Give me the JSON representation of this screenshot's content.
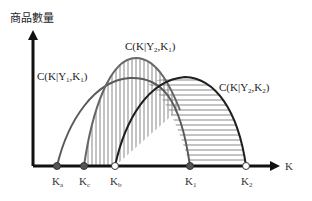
{
  "diagram": {
    "y_axis_label": "商品數量",
    "x_axis_label": "K",
    "curves": [
      {
        "id": "y1k1",
        "label_main": "C(K|Y",
        "label_sub1": "1",
        "label_mid": ",K",
        "label_sub2": "1",
        "label_end": ")",
        "color": "#555555"
      },
      {
        "id": "y2k1",
        "label_main": "C(K|Y",
        "label_sub1": "2",
        "label_mid": ",K",
        "label_sub2": "1",
        "label_end": ")",
        "color": "#666666",
        "hatch": "vertical"
      },
      {
        "id": "y2k2",
        "label_main": "C(K|Y",
        "label_sub1": "2",
        "label_mid": ",K",
        "label_sub2": "2",
        "label_end": ")",
        "color": "#222222",
        "hatch": "horizontal"
      }
    ],
    "x_points": [
      {
        "name": "K",
        "sub": "a",
        "marker": "filled"
      },
      {
        "name": "K",
        "sub": "c",
        "marker": "filled"
      },
      {
        "name": "K",
        "sub": "b",
        "marker": "open"
      },
      {
        "name": "K",
        "sub": "1",
        "marker": "filled"
      },
      {
        "name": "K",
        "sub": "2",
        "marker": "open"
      }
    ]
  }
}
